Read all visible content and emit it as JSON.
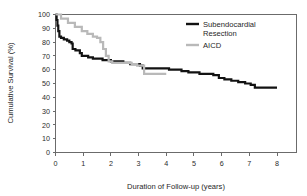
{
  "chart_data": {
    "type": "line",
    "title": "",
    "xlabel": "Duration of Follow-up (years)",
    "ylabel": "Cumulative Survival (%)",
    "xlim": [
      0,
      8
    ],
    "ylim": [
      0,
      100
    ],
    "xticks": [
      0,
      1,
      2,
      3,
      4,
      5,
      6,
      7,
      8
    ],
    "yticks": [
      0,
      10,
      20,
      30,
      40,
      50,
      60,
      70,
      80,
      90,
      100
    ],
    "xtick_labels": [
      "0",
      "1",
      "2",
      "3",
      "4",
      "5",
      "6",
      "7",
      "8"
    ],
    "ytick_labels": [
      "0",
      "10",
      "20",
      "30",
      "40",
      "50",
      "60",
      "70",
      "80",
      "90",
      "100"
    ],
    "grid": false,
    "legend_position": "upper right",
    "series": [
      {
        "name": "Subendocardial Resection",
        "color": "#121212",
        "line_width": 2.2,
        "step": true,
        "points": [
          [
            0.0,
            100
          ],
          [
            0.04,
            96
          ],
          [
            0.07,
            92
          ],
          [
            0.1,
            88
          ],
          [
            0.14,
            84
          ],
          [
            0.2,
            83
          ],
          [
            0.3,
            82
          ],
          [
            0.42,
            81
          ],
          [
            0.5,
            80
          ],
          [
            0.58,
            79
          ],
          [
            0.62,
            75
          ],
          [
            0.72,
            74
          ],
          [
            0.8,
            74
          ],
          [
            0.88,
            72
          ],
          [
            0.95,
            70
          ],
          [
            1.05,
            70
          ],
          [
            1.18,
            69
          ],
          [
            1.35,
            68
          ],
          [
            1.52,
            68
          ],
          [
            1.7,
            67
          ],
          [
            1.85,
            67
          ],
          [
            2.0,
            66
          ],
          [
            2.2,
            66
          ],
          [
            2.45,
            65
          ],
          [
            2.7,
            64
          ],
          [
            2.9,
            64
          ],
          [
            3.05,
            63
          ],
          [
            3.15,
            61
          ],
          [
            3.35,
            61
          ],
          [
            3.6,
            61
          ],
          [
            3.9,
            61
          ],
          [
            4.1,
            60
          ],
          [
            4.35,
            60
          ],
          [
            4.55,
            59
          ],
          [
            4.8,
            58
          ],
          [
            5.0,
            58
          ],
          [
            5.2,
            57
          ],
          [
            5.45,
            57
          ],
          [
            5.7,
            56
          ],
          [
            5.9,
            54
          ],
          [
            6.1,
            53
          ],
          [
            6.35,
            52
          ],
          [
            6.6,
            51
          ],
          [
            6.85,
            50
          ],
          [
            7.05,
            49
          ],
          [
            7.2,
            47
          ],
          [
            7.6,
            47
          ],
          [
            8.0,
            47
          ]
        ]
      },
      {
        "name": "AICD",
        "color": "#b9b9b9",
        "line_width": 2.2,
        "step": true,
        "points": [
          [
            0.0,
            100
          ],
          [
            0.2,
            97
          ],
          [
            0.45,
            94
          ],
          [
            0.7,
            91
          ],
          [
            0.95,
            88
          ],
          [
            1.15,
            86
          ],
          [
            1.35,
            84
          ],
          [
            1.5,
            83
          ],
          [
            1.62,
            80
          ],
          [
            1.72,
            75
          ],
          [
            1.82,
            70
          ],
          [
            1.92,
            66
          ],
          [
            2.05,
            65
          ],
          [
            2.3,
            65
          ],
          [
            2.55,
            65
          ],
          [
            2.75,
            64
          ],
          [
            2.95,
            63
          ],
          [
            3.1,
            63
          ],
          [
            3.2,
            57
          ],
          [
            3.5,
            57
          ],
          [
            3.75,
            57
          ],
          [
            4.0,
            57
          ]
        ]
      }
    ],
    "legend": [
      {
        "label_line1": "Subendocardial",
        "label_line2": "Resection",
        "color": "#121212"
      },
      {
        "label_line1": "AICD",
        "label_line2": "",
        "color": "#b9b9b9"
      }
    ]
  },
  "axes": {
    "y_axis_title": "Cumulative Survival (%)",
    "x_axis_title": "Duration of Follow-up (years)"
  },
  "colors": {
    "frame": "#6b6b6b",
    "background": "#ffffff",
    "series_primary": "#121212",
    "series_secondary": "#b9b9b9"
  }
}
